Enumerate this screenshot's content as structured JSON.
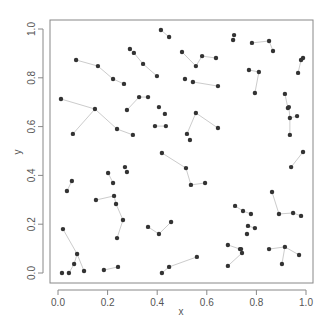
{
  "chart_data": {
    "type": "scatter",
    "title": "",
    "xlabel": "x",
    "ylabel": "y",
    "xlim": [
      0.0,
      1.0
    ],
    "ylim": [
      0.0,
      1.0
    ],
    "grid": false,
    "legend": null,
    "x_ticks": [
      "0.0",
      "0.2",
      "0.4",
      "0.6",
      "0.8",
      "1.0"
    ],
    "y_ticks": [
      "0.0",
      "0.2",
      "0.4",
      "0.6",
      "0.8",
      "1.0"
    ],
    "point_color": "#333333",
    "segment_color": "#cccccc",
    "segments": [
      [
        [
          0.012,
          0.713
        ],
        [
          0.149,
          0.672
        ]
      ],
      [
        [
          0.149,
          0.672
        ],
        [
          0.06,
          0.57
        ]
      ],
      [
        [
          0.149,
          0.672
        ],
        [
          0.238,
          0.59
        ]
      ],
      [
        [
          0.238,
          0.59
        ],
        [
          0.302,
          0.566
        ]
      ],
      [
        [
          0.073,
          0.873
        ],
        [
          0.161,
          0.848
        ]
      ],
      [
        [
          0.161,
          0.848
        ],
        [
          0.222,
          0.795
        ]
      ],
      [
        [
          0.222,
          0.795
        ],
        [
          0.266,
          0.775
        ]
      ],
      [
        [
          0.29,
          0.918
        ],
        [
          0.306,
          0.902
        ]
      ],
      [
        [
          0.306,
          0.902
        ],
        [
          0.343,
          0.857
        ]
      ],
      [
        [
          0.343,
          0.857
        ],
        [
          0.399,
          0.807
        ]
      ],
      [
        [
          0.415,
          0.996
        ],
        [
          0.448,
          0.967
        ]
      ],
      [
        [
          0.278,
          0.668
        ],
        [
          0.327,
          0.721
        ]
      ],
      [
        [
          0.327,
          0.721
        ],
        [
          0.363,
          0.721
        ]
      ],
      [
        [
          0.5,
          0.906
        ],
        [
          0.556,
          0.848
        ]
      ],
      [
        [
          0.556,
          0.848
        ],
        [
          0.581,
          0.889
        ]
      ],
      [
        [
          0.581,
          0.889
        ],
        [
          0.637,
          0.881
        ]
      ],
      [
        [
          0.544,
          0.783
        ],
        [
          0.645,
          0.766
        ]
      ],
      [
        [
          0.391,
          0.602
        ],
        [
          0.435,
          0.602
        ]
      ],
      [
        [
          0.556,
          0.656
        ],
        [
          0.645,
          0.594
        ]
      ],
      [
        [
          0.556,
          0.656
        ],
        [
          0.52,
          0.57
        ]
      ],
      [
        [
          0.782,
          0.943
        ],
        [
          0.851,
          0.951
        ]
      ],
      [
        [
          0.851,
          0.951
        ],
        [
          0.867,
          0.91
        ]
      ],
      [
        [
          0.988,
          0.881
        ],
        [
          0.98,
          0.873
        ]
      ],
      [
        [
          0.98,
          0.873
        ],
        [
          0.968,
          0.82
        ]
      ],
      [
        [
          0.77,
          0.832
        ],
        [
          0.81,
          0.824
        ]
      ],
      [
        [
          0.81,
          0.824
        ],
        [
          0.794,
          0.738
        ]
      ],
      [
        [
          0.915,
          0.734
        ],
        [
          0.927,
          0.676
        ]
      ],
      [
        [
          0.931,
          0.68
        ],
        [
          0.935,
          0.635
        ]
      ],
      [
        [
          0.935,
          0.635
        ],
        [
          0.964,
          0.643
        ]
      ],
      [
        [
          0.935,
          0.635
        ],
        [
          0.935,
          0.566
        ]
      ],
      [
        [
          0.988,
          0.496
        ],
        [
          0.94,
          0.434
        ]
      ],
      [
        [
          0.419,
          0.492
        ],
        [
          0.516,
          0.43
        ]
      ],
      [
        [
          0.516,
          0.43
        ],
        [
          0.536,
          0.361
        ]
      ],
      [
        [
          0.536,
          0.361
        ],
        [
          0.593,
          0.369
        ]
      ],
      [
        [
          0.056,
          0.377
        ],
        [
          0.036,
          0.336
        ]
      ],
      [
        [
          0.153,
          0.299
        ],
        [
          0.226,
          0.316
        ]
      ],
      [
        [
          0.226,
          0.316
        ],
        [
          0.234,
          0.283
        ]
      ],
      [
        [
          0.234,
          0.283
        ],
        [
          0.262,
          0.217
        ]
      ],
      [
        [
          0.262,
          0.217
        ],
        [
          0.238,
          0.143
        ]
      ],
      [
        [
          0.202,
          0.41
        ],
        [
          0.222,
          0.369
        ]
      ],
      [
        [
          0.02,
          0.18
        ],
        [
          0.077,
          0.078
        ]
      ],
      [
        [
          0.077,
          0.078
        ],
        [
          0.065,
          0.037
        ]
      ],
      [
        [
          0.065,
          0.037
        ],
        [
          0.044,
          0.0
        ]
      ],
      [
        [
          0.077,
          0.078
        ],
        [
          0.105,
          0.008
        ]
      ],
      [
        [
          0.185,
          0.012
        ],
        [
          0.242,
          0.025
        ]
      ],
      [
        [
          0.363,
          0.189
        ],
        [
          0.407,
          0.16
        ]
      ],
      [
        [
          0.407,
          0.16
        ],
        [
          0.456,
          0.209
        ]
      ],
      [
        [
          0.419,
          0.0
        ],
        [
          0.448,
          0.025
        ]
      ],
      [
        [
          0.448,
          0.025
        ],
        [
          0.56,
          0.066
        ]
      ],
      [
        [
          0.863,
          0.332
        ],
        [
          0.891,
          0.242
        ]
      ],
      [
        [
          0.891,
          0.242
        ],
        [
          0.948,
          0.246
        ]
      ],
      [
        [
          0.948,
          0.246
        ],
        [
          0.98,
          0.234
        ]
      ],
      [
        [
          0.714,
          0.275
        ],
        [
          0.746,
          0.254
        ]
      ],
      [
        [
          0.746,
          0.254
        ],
        [
          0.778,
          0.242
        ]
      ],
      [
        [
          0.685,
          0.115
        ],
        [
          0.734,
          0.098
        ]
      ],
      [
        [
          0.734,
          0.098
        ],
        [
          0.742,
          0.082
        ]
      ],
      [
        [
          0.742,
          0.082
        ],
        [
          0.685,
          0.029
        ]
      ],
      [
        [
          0.851,
          0.098
        ],
        [
          0.915,
          0.107
        ]
      ],
      [
        [
          0.915,
          0.107
        ],
        [
          0.972,
          0.074
        ]
      ],
      [
        [
          0.915,
          0.107
        ],
        [
          0.903,
          0.037
        ]
      ],
      [
        [
          0.766,
          0.193
        ],
        [
          0.794,
          0.184
        ]
      ]
    ],
    "isolated_points": [
      [
        0.71,
        0.975
      ],
      [
        0.706,
        0.955
      ],
      [
        0.512,
        0.795
      ],
      [
        0.407,
        0.68
      ],
      [
        0.431,
        0.652
      ],
      [
        0.532,
        0.545
      ],
      [
        0.27,
        0.434
      ],
      [
        0.278,
        0.414
      ],
      [
        0.016,
        0.0
      ],
      [
        0.762,
        0.16
      ],
      [
        0.738,
        0.098
      ]
    ]
  }
}
